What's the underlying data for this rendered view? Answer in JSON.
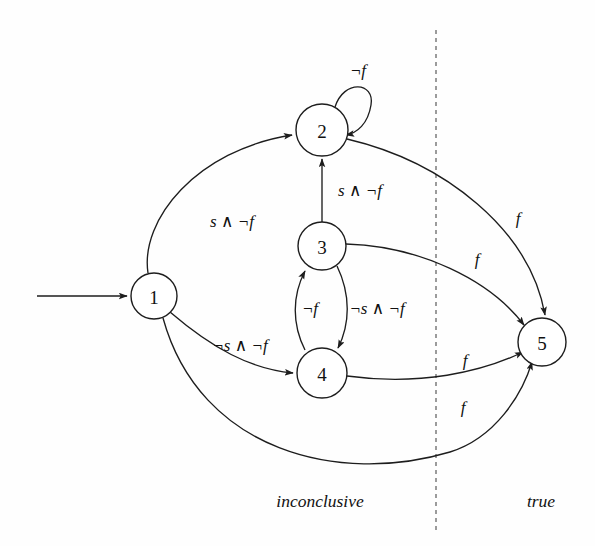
{
  "diagram": {
    "type": "state-machine",
    "title": "",
    "width": 595,
    "height": 546,
    "background_color": "#fefefe",
    "stroke_color": "#1d1d1d"
  },
  "states": [
    {
      "id": "1",
      "label": "1",
      "cx": 154,
      "cy": 296,
      "r": 23
    },
    {
      "id": "2",
      "label": "2",
      "cx": 322,
      "cy": 130,
      "r": 26
    },
    {
      "id": "3",
      "label": "3",
      "cx": 322,
      "cy": 246,
      "r": 24
    },
    {
      "id": "4",
      "label": "4",
      "cx": 322,
      "cy": 373,
      "r": 25
    },
    {
      "id": "5",
      "label": "5",
      "cx": 542,
      "cy": 342,
      "r": 24
    }
  ],
  "initial_arrow": {
    "name": "start-arrow",
    "from_x": 37,
    "to_x": 129,
    "y": 296
  },
  "transitions": [
    {
      "from": "1",
      "to": "2",
      "label": "s ∧ ¬f",
      "label_x": 232,
      "label_y": 221
    },
    {
      "from": "1",
      "to": "4",
      "label": "¬s ∧ ¬f",
      "label_x": 240,
      "label_y": 345
    },
    {
      "from": "1",
      "to": "5",
      "label": "f",
      "label_x": 463,
      "label_y": 407
    },
    {
      "from": "2",
      "to": "2",
      "label": "¬f",
      "label_x": 358,
      "label_y": 70
    },
    {
      "from": "2",
      "to": "5",
      "label": "f",
      "label_x": 518,
      "label_y": 218
    },
    {
      "from": "3",
      "to": "2",
      "label": "s ∧ ¬f",
      "label_x": 360,
      "label_y": 190
    },
    {
      "from": "3",
      "to": "4",
      "label": "¬s ∧ ¬f",
      "label_x": 377,
      "label_y": 308
    },
    {
      "from": "3",
      "to": "5",
      "label": "f",
      "label_x": 477,
      "label_y": 259
    },
    {
      "from": "4",
      "to": "3",
      "label": "¬f",
      "label_x": 310,
      "label_y": 308
    },
    {
      "from": "4",
      "to": "5",
      "label": "f",
      "label_x": 465,
      "label_y": 360
    }
  ],
  "divider": {
    "name": "region-divider",
    "x": 436,
    "y_top": 30,
    "y_bottom": 530,
    "style": "dashed"
  },
  "regions": [
    {
      "id": "inconclusive",
      "label": "inconclusive",
      "x": 320,
      "y": 501
    },
    {
      "id": "true",
      "label": "true",
      "x": 541,
      "y": 501
    }
  ]
}
